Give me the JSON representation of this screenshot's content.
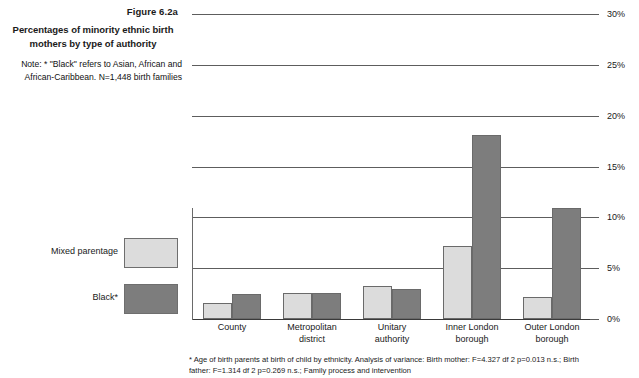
{
  "figure": {
    "number": "Figure 6.2a",
    "title": "Percentages of minority ethnic birth mothers by type of authority",
    "note": "Note: * \"Black\" refers to Asian, African and African-Caribbean. N=1,448 birth families"
  },
  "legend": {
    "items": [
      {
        "label": "Mixed parentage",
        "color": "#dcdcdc",
        "swatch_name": "mixed-parentage"
      },
      {
        "label": "Black*",
        "color": "#7d7d7d",
        "swatch_name": "black"
      }
    ]
  },
  "footnote": {
    "line1": "* Age of birth parents at birth of child by ethnicity. Analysis of variance: Birth mother: F=4.327 df 2 p=0.013 n.s.; Birth",
    "line2": "father: F=1.314 df 2 p=0.269 n.s.; Family process and intervention"
  },
  "chart_data": {
    "type": "bar",
    "title": "Percentages of minority ethnic birth mothers by type of authority",
    "xlabel": "",
    "ylabel": "",
    "ylim": [
      0,
      30
    ],
    "yticks": [
      0,
      5,
      10,
      15,
      20,
      25,
      30
    ],
    "ytick_labels": [
      "0%",
      "5%",
      "10%",
      "15%",
      "20%",
      "25%",
      "30%"
    ],
    "grid": true,
    "y_axis_position": "right",
    "legend_position": "left-panel",
    "categories": [
      "County",
      "Metropolitan district",
      "Unitary authority",
      "Inner London borough",
      "Outer London borough"
    ],
    "category_lines": [
      [
        "County"
      ],
      [
        "Metropolitan",
        "district"
      ],
      [
        "Unitary",
        "authority"
      ],
      [
        "Inner London",
        "borough"
      ],
      [
        "Outer London",
        "borough"
      ]
    ],
    "series": [
      {
        "name": "Mixed parentage",
        "color": "#dcdcdc",
        "values": [
          1.6,
          2.6,
          3.2,
          7.2,
          2.2
        ]
      },
      {
        "name": "Black*",
        "color": "#7d7d7d",
        "values": [
          2.5,
          2.6,
          3.0,
          18.1,
          10.9
        ]
      }
    ]
  }
}
